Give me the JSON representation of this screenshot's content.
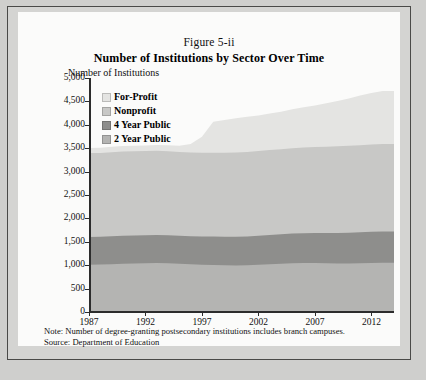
{
  "figure": {
    "number": "Figure 5-ii",
    "title": "Number of Institutions by Sector Over Time",
    "y_axis_title": "Number of Institutions",
    "note": "Note: Number of degree-granting postsecondary institutions includes branch campuses.",
    "source": "Source: Department of Education"
  },
  "colors": {
    "for_profit": "#e4e4e2",
    "nonprofit": "#c8c8c6",
    "four_year_public": "#8e8e8c",
    "two_year_public": "#b4b4b2",
    "axis": "#2c2c2c",
    "panel": "#fbfbfa",
    "frame": "#d4d4d2",
    "frame_border": "#4a4a48"
  },
  "chart_data": {
    "type": "area",
    "stacked": true,
    "title": "Number of Institutions by Sector Over Time",
    "subtitle": "Figure 5-ii",
    "xlabel": "",
    "ylabel": "Number of Institutions",
    "xlim": [
      1987,
      2014
    ],
    "ylim": [
      0,
      5000
    ],
    "grid": false,
    "legend_position": "top-left-inside",
    "y_ticks": [
      "0",
      "500",
      "1,000",
      "1,500",
      "2,000",
      "2,500",
      "3,000",
      "3,500",
      "4,000",
      "4,500",
      "5,000"
    ],
    "y_tick_values": [
      0,
      500,
      1000,
      1500,
      2000,
      2500,
      3000,
      3500,
      4000,
      4500,
      5000
    ],
    "x_ticks": [
      "1987",
      "1992",
      "1997",
      "2002",
      "2007",
      "2012"
    ],
    "x_tick_values": [
      1987,
      1992,
      1997,
      2002,
      2007,
      2012
    ],
    "x": [
      1987,
      1988,
      1989,
      1990,
      1991,
      1992,
      1993,
      1994,
      1995,
      1996,
      1997,
      1998,
      1999,
      2000,
      2001,
      2002,
      2003,
      2004,
      2005,
      2006,
      2007,
      2008,
      2009,
      2010,
      2011,
      2012,
      2013,
      2014
    ],
    "series": [
      {
        "name": "2 Year Public",
        "color": "#b4b4b2",
        "stack_order": 1,
        "values": [
          1010,
          1015,
          1020,
          1030,
          1035,
          1040,
          1045,
          1040,
          1030,
          1020,
          1010,
          1005,
          1000,
          995,
          1000,
          1010,
          1020,
          1030,
          1040,
          1045,
          1045,
          1040,
          1035,
          1035,
          1040,
          1045,
          1050,
          1050
        ]
      },
      {
        "name": "4 Year Public",
        "color": "#8e8e8c",
        "stack_order": 2,
        "values": [
          595,
          595,
          600,
          600,
          600,
          600,
          600,
          600,
          600,
          600,
          605,
          610,
          610,
          615,
          615,
          620,
          625,
          630,
          635,
          640,
          645,
          650,
          655,
          660,
          665,
          670,
          672,
          672
        ]
      },
      {
        "name": "Nonprofit",
        "color": "#c8c8c6",
        "stack_order": 3,
        "values": [
          1790,
          1790,
          1795,
          1800,
          1800,
          1800,
          1800,
          1795,
          1790,
          1790,
          1790,
          1790,
          1795,
          1800,
          1805,
          1810,
          1815,
          1820,
          1825,
          1830,
          1835,
          1840,
          1850,
          1855,
          1860,
          1865,
          1870,
          1870
        ]
      },
      {
        "name": "For-Profit",
        "color": "#e4e4e2",
        "stack_order": 4,
        "values": [
          110,
          110,
          115,
          115,
          120,
          120,
          125,
          130,
          135,
          180,
          340,
          660,
          700,
          730,
          750,
          760,
          780,
          800,
          830,
          860,
          890,
          930,
          970,
          1010,
          1060,
          1100,
          1130,
          1130
        ]
      }
    ],
    "totals": [
      3505,
      3510,
      3530,
      3545,
      3555,
      3560,
      3570,
      3565,
      3555,
      3590,
      3745,
      4065,
      4105,
      4140,
      4170,
      4200,
      4240,
      4280,
      4330,
      4375,
      4415,
      4460,
      4510,
      4560,
      4625,
      4680,
      4722,
      4722
    ]
  },
  "legend": {
    "items": [
      {
        "label": "For-Profit",
        "color": "#e4e4e2"
      },
      {
        "label": "Nonprofit",
        "color": "#c8c8c6"
      },
      {
        "label": "4 Year Public",
        "color": "#8e8e8c"
      },
      {
        "label": "2 Year Public",
        "color": "#b4b4b2"
      }
    ]
  }
}
